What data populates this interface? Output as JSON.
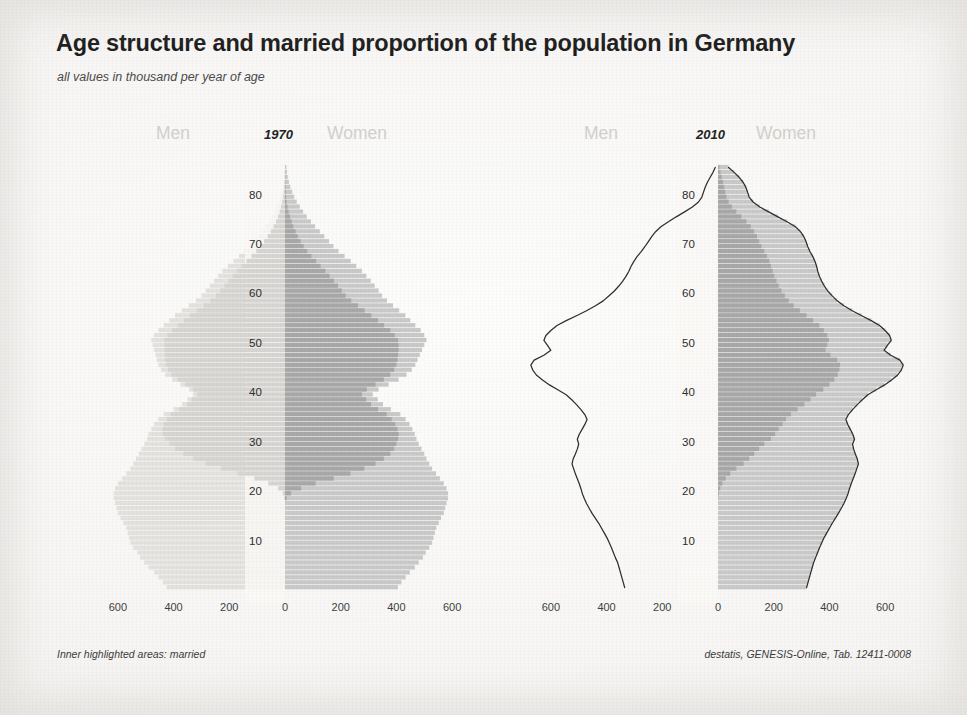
{
  "header": {
    "title": "Age structure and married proportion of the population in Germany",
    "subtitle": "all values in thousand per year of age"
  },
  "footer": {
    "note": "Inner highlighted areas: married",
    "source": "destatis, GENESIS-Online, Tab. 12411-0008"
  },
  "labels": {
    "men": "Men",
    "women": "Women",
    "year_1970": "1970",
    "year_2010": "2010"
  },
  "colors": {
    "total_bar": "#c9c9c9",
    "married_bar": "#a8a8a8",
    "outline": "#2e2e2e",
    "faded_bar": "#e3e2df",
    "axis_text": "#2d2d2d",
    "title_text": "#1b1b1b",
    "side_label": "#d2d0cd",
    "paper": "#f8f7f5"
  },
  "chart_data": {
    "type": "bar",
    "title": "Age structure and married proportion of the population in Germany",
    "subtitle": "all values in thousand per year of age",
    "orientation": "horizontal-population-pyramid",
    "xlabel": "",
    "ylabel": "",
    "grid": false,
    "legend_position": "none",
    "annotations": [
      "Inner highlighted areas: married"
    ],
    "source": "destatis, GENESIS-Online, Tab. 12411-0008",
    "x_ticks_left": [
      600,
      400,
      200,
      0
    ],
    "x_ticks_right": [
      200,
      400,
      600
    ],
    "x_tick_labels": [
      "600",
      "400",
      "200",
      "0",
      "200",
      "400",
      "600"
    ],
    "xlim": [
      0,
      700
    ],
    "y_ticks": [
      10,
      20,
      30,
      40,
      50,
      60,
      70,
      80
    ],
    "ylim": [
      0,
      87
    ],
    "ages": [
      0,
      1,
      2,
      3,
      4,
      5,
      6,
      7,
      8,
      9,
      10,
      11,
      12,
      13,
      14,
      15,
      16,
      17,
      18,
      19,
      20,
      21,
      22,
      23,
      24,
      25,
      26,
      27,
      28,
      29,
      30,
      31,
      32,
      33,
      34,
      35,
      36,
      37,
      38,
      39,
      40,
      41,
      42,
      43,
      44,
      45,
      46,
      47,
      48,
      49,
      50,
      51,
      52,
      53,
      54,
      55,
      56,
      57,
      58,
      59,
      60,
      61,
      62,
      63,
      64,
      65,
      66,
      67,
      68,
      69,
      70,
      71,
      72,
      73,
      74,
      75,
      76,
      77,
      78,
      79,
      80,
      81,
      82,
      83,
      84,
      85
    ],
    "panels": [
      {
        "year": "1970",
        "emphasis": "women",
        "series": [
          {
            "name": "Men total 1970",
            "side": "left",
            "style": "faded",
            "values": [
              425,
              438,
              455,
              470,
              490,
              505,
              520,
              530,
              545,
              555,
              560,
              565,
              570,
              580,
              590,
              600,
              605,
              610,
              615,
              615,
              610,
              600,
              585,
              570,
              555,
              545,
              535,
              525,
              515,
              505,
              495,
              490,
              480,
              470,
              455,
              435,
              400,
              370,
              350,
              330,
              345,
              375,
              405,
              430,
              445,
              455,
              460,
              465,
              470,
              475,
              480,
              470,
              455,
              435,
              415,
              395,
              370,
              345,
              320,
              300,
              285,
              270,
              255,
              240,
              225,
              205,
              185,
              165,
              145,
              128,
              112,
              96,
              82,
              68,
              56,
              45,
              36,
              28,
              21,
              16,
              12,
              8,
              6,
              4,
              3,
              2
            ]
          },
          {
            "name": "Men married 1970",
            "side": "left",
            "style": "faded-inner",
            "values": [
              0,
              0,
              0,
              0,
              0,
              0,
              0,
              0,
              0,
              0,
              0,
              0,
              0,
              0,
              0,
              0,
              0,
              0,
              2,
              8,
              25,
              60,
              110,
              170,
              230,
              285,
              330,
              365,
              395,
              415,
              430,
              440,
              440,
              435,
              425,
              410,
              380,
              352,
              335,
              316,
              330,
              358,
              385,
              408,
              420,
              428,
              430,
              432,
              432,
              433,
              434,
              422,
              406,
              385,
              363,
              342,
              317,
              292,
              268,
              248,
              232,
              217,
              203,
              188,
              173,
              155,
              138,
              120,
              103,
              88,
              75,
              62,
              51,
              41,
              32,
              25,
              19,
              14,
              10,
              7,
              5,
              3,
              2,
              1,
              1,
              0
            ]
          },
          {
            "name": "Women total 1970",
            "side": "right",
            "style": "solid",
            "values": [
              405,
              418,
              433,
              448,
              466,
              480,
              495,
              505,
              518,
              528,
              533,
              538,
              543,
              552,
              560,
              570,
              575,
              580,
              585,
              585,
              580,
              570,
              556,
              542,
              528,
              518,
              508,
              500,
              490,
              480,
              472,
              466,
              457,
              447,
              433,
              414,
              380,
              352,
              333,
              315,
              336,
              372,
              408,
              436,
              455,
              468,
              476,
              484,
              492,
              500,
              508,
              500,
              487,
              468,
              450,
              432,
              410,
              388,
              366,
              348,
              336,
              322,
              308,
              292,
              276,
              256,
              236,
              214,
              192,
              174,
              158,
              141,
              125,
              108,
              93,
              78,
              65,
              53,
              42,
              33,
              26,
              19,
              14,
              10,
              7,
              5
            ]
          },
          {
            "name": "Women married 1970",
            "side": "right",
            "style": "inner",
            "values": [
              0,
              0,
              0,
              0,
              0,
              0,
              0,
              0,
              0,
              0,
              0,
              0,
              0,
              0,
              0,
              0,
              0,
              0,
              6,
              22,
              58,
              110,
              175,
              235,
              285,
              325,
              355,
              378,
              392,
              400,
              406,
              408,
              404,
              396,
              383,
              365,
              334,
              309,
              292,
              276,
              294,
              325,
              355,
              378,
              392,
              400,
              404,
              406,
              408,
              408,
              406,
              394,
              378,
              356,
              334,
              310,
              286,
              262,
              238,
              218,
              204,
              190,
              176,
              160,
              145,
              128,
              112,
              95,
              80,
              67,
              56,
              46,
              38,
              30,
              24,
              18,
              13,
              9,
              6,
              4,
              3,
              2,
              1,
              1,
              0,
              0
            ]
          }
        ]
      },
      {
        "year": "2010",
        "emphasis": "both",
        "series": [
          {
            "name": "Men total 2010",
            "side": "left",
            "style": "outline",
            "values": [
              335,
              340,
              345,
              350,
              355,
              360,
              368,
              375,
              382,
              390,
              398,
              408,
              418,
              428,
              440,
              452,
              462,
              472,
              480,
              487,
              492,
              498,
              505,
              512,
              518,
              524,
              520,
              512,
              505,
              500,
              505,
              498,
              488,
              478,
              470,
              478,
              492,
              508,
              525,
              545,
              575,
              605,
              630,
              652,
              665,
              672,
              660,
              625,
              600,
              612,
              625,
              618,
              600,
              578,
              545,
              508,
              472,
              440,
              412,
              392,
              372,
              356,
              342,
              330,
              320,
              312,
              302,
              290,
              275,
              262,
              250,
              238,
              224,
              205,
              178,
              150,
              120,
              92,
              70,
              58,
              52,
              46,
              38,
              28,
              18,
              10
            ]
          },
          {
            "name": "Women total 2010",
            "side": "right",
            "style": "outline-bars",
            "values": [
              318,
              323,
              328,
              333,
              338,
              343,
              350,
              357,
              364,
              372,
              380,
              390,
              400,
              410,
              421,
              432,
              442,
              452,
              460,
              467,
              472,
              478,
              485,
              492,
              498,
              504,
              500,
              493,
              487,
              483,
              490,
              484,
              475,
              466,
              459,
              468,
              483,
              500,
              518,
              538,
              568,
              598,
              623,
              645,
              658,
              665,
              653,
              620,
              596,
              608,
              622,
              616,
              600,
              580,
              550,
              516,
              482,
              452,
              428,
              410,
              394,
              382,
              372,
              364,
              358,
              354,
              348,
              340,
              330,
              322,
              316,
              308,
              296,
              278,
              248,
              215,
              182,
              150,
              126,
              112,
              106,
              100,
              90,
              76,
              58,
              38
            ]
          },
          {
            "name": "Women married 2010",
            "side": "right",
            "style": "inner",
            "values": [
              0,
              0,
              0,
              0,
              0,
              0,
              0,
              0,
              0,
              0,
              0,
              0,
              0,
              0,
              0,
              0,
              0,
              0,
              1,
              3,
              8,
              16,
              28,
              44,
              66,
              92,
              112,
              130,
              148,
              166,
              190,
              205,
              218,
              232,
              244,
              262,
              286,
              310,
              332,
              352,
              378,
              400,
              418,
              430,
              436,
              438,
              428,
              404,
              386,
              392,
              398,
              392,
              380,
              364,
              342,
              318,
              294,
              272,
              254,
              240,
              228,
              218,
              210,
              202,
              196,
              190,
              184,
              176,
              166,
              156,
              148,
              140,
              130,
              118,
              102,
              84,
              66,
              50,
              38,
              30,
              26,
              22,
              18,
              13,
              9,
              5
            ]
          }
        ]
      }
    ]
  }
}
